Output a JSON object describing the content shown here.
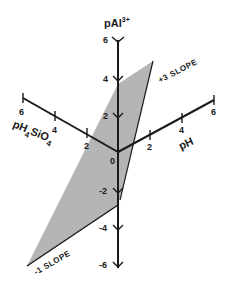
{
  "diagram": {
    "type": "3d-axes-plane",
    "vertical_axis": {
      "title": "pAl",
      "superscript": "3+",
      "ticks": [
        "6",
        "4",
        "2",
        "0",
        "-2",
        "-4",
        "-6"
      ]
    },
    "left_axis": {
      "title": "pH",
      "subscript": "4",
      "title2": "SiO",
      "subscript2": "4",
      "ticks": [
        "2",
        "4",
        "6"
      ]
    },
    "right_axis": {
      "title": "pH",
      "ticks": [
        "2",
        "4",
        "6"
      ]
    },
    "annotations": {
      "upper_slope": "+3 SLOPE",
      "lower_slope": "-1 SLOPE"
    },
    "colors": {
      "plane_fill": "#b3b3b3",
      "axis": "#1a1a1a"
    }
  }
}
